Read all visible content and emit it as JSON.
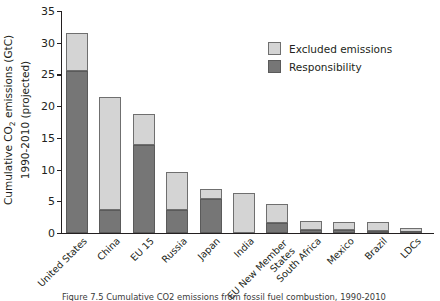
{
  "chart_data": {
    "type": "bar",
    "stacked": true,
    "title": "",
    "xlabel": "",
    "ylabel": "Cumulative CO2 emissions (GtC) 1990-2010 (projected)",
    "ylabel_line1": "Cumulative CO",
    "ylabel_line1_sub": "2",
    "ylabel_line1_rest": " emissions (GtC)",
    "ylabel_line2": "1990-2010 (projected)",
    "ylim": [
      0,
      35
    ],
    "yticks": [
      0,
      5,
      10,
      15,
      20,
      25,
      30,
      35
    ],
    "grid": false,
    "legend_position": "top-right",
    "categories": [
      "United States",
      "China",
      "EU 15",
      "Russia",
      "Japan",
      "India",
      "EU New Member States",
      "South Africa",
      "Mexico",
      "Brazil",
      "LDCs"
    ],
    "category_lines": [
      [
        "United States"
      ],
      [
        "China"
      ],
      [
        "EU 15"
      ],
      [
        "Russia"
      ],
      [
        "Japan"
      ],
      [
        "India"
      ],
      [
        "EU New Member",
        "States"
      ],
      [
        "South Africa"
      ],
      [
        "Mexico"
      ],
      [
        "Brazil"
      ],
      [
        "LDCs"
      ]
    ],
    "series": [
      {
        "name": "Responsibility",
        "color": "#767676",
        "values": [
          25.6,
          3.6,
          13.9,
          3.7,
          5.3,
          0.0,
          1.6,
          0.5,
          0.5,
          0.3,
          0.1
        ]
      },
      {
        "name": "Excluded emissions",
        "color": "#d4d4d4",
        "values": [
          5.9,
          17.8,
          4.9,
          5.9,
          1.7,
          6.3,
          2.9,
          1.4,
          1.3,
          1.4,
          0.7
        ]
      }
    ],
    "totals": [
      31.5,
      21.4,
      18.8,
      9.6,
      7.0,
      6.3,
      4.5,
      1.9,
      1.8,
      1.7,
      0.8
    ]
  },
  "legend": {
    "items": [
      {
        "label": "Excluded emissions",
        "swatch": "excluded"
      },
      {
        "label": "Responsibility",
        "swatch": "resp"
      }
    ]
  },
  "caption": {
    "text": "Figure 7.5  Cumulative CO2 emissions from fossil fuel combustion, 1990-2010"
  }
}
